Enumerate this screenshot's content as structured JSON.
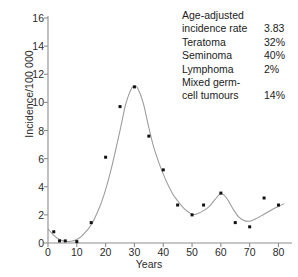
{
  "chart_data": {
    "type": "line",
    "title": "",
    "xlabel": "Years",
    "ylabel": "Incidence/100 000",
    "xlim": [
      0,
      84
    ],
    "ylim": [
      0,
      16
    ],
    "xticks": [
      0,
      10,
      20,
      30,
      40,
      50,
      60,
      70,
      80
    ],
    "yticks": [
      0,
      2,
      4,
      6,
      8,
      10,
      12,
      14,
      16
    ],
    "grid": false,
    "legend_position": "top-right",
    "series": [
      {
        "name": "Observed incidence",
        "marker": "square",
        "marker_color": "#111111",
        "x": [
          2,
          4,
          6,
          10,
          15,
          20,
          25,
          30,
          35,
          40,
          45,
          50,
          54,
          60,
          65,
          70,
          75,
          80
        ],
        "values": [
          0.8,
          0.15,
          0.15,
          0.1,
          1.45,
          6.1,
          9.7,
          11.1,
          7.6,
          5.2,
          2.7,
          2.0,
          2.7,
          3.55,
          1.45,
          1.15,
          3.2,
          2.7
        ]
      },
      {
        "name": "Fitted curve",
        "marker": "none",
        "line_color": "#9a9a9a",
        "x": [
          0,
          2,
          4,
          6,
          8,
          10,
          12,
          15,
          18,
          20,
          22,
          25,
          27,
          29,
          30,
          31,
          33,
          35,
          37,
          40,
          43,
          45,
          47,
          50,
          52,
          54,
          56,
          58,
          60,
          62,
          64,
          66,
          68,
          70,
          72,
          75,
          78,
          80,
          82
        ],
        "values": [
          1.0,
          0.55,
          0.25,
          0.12,
          0.12,
          0.25,
          0.55,
          1.3,
          2.6,
          3.8,
          5.3,
          8.0,
          9.9,
          11.0,
          11.15,
          11.05,
          10.0,
          8.2,
          6.6,
          4.9,
          3.6,
          3.0,
          2.5,
          2.05,
          2.1,
          2.3,
          2.6,
          3.1,
          3.5,
          3.2,
          2.5,
          1.9,
          1.6,
          1.55,
          1.7,
          2.05,
          2.4,
          2.6,
          2.8
        ]
      }
    ]
  },
  "legend": {
    "rows": [
      {
        "key": "Age-adjusted",
        "value": "",
        "single": true
      },
      {
        "key": "incidence rate",
        "value": "3.83",
        "single": false
      },
      {
        "key": "Teratoma",
        "value": "32%",
        "single": false
      },
      {
        "key": "Seminoma",
        "value": "40%",
        "single": false
      },
      {
        "key": "Lymphoma",
        "value": "2%",
        "single": false
      },
      {
        "key": "Mixed germ-",
        "value": "",
        "single": true
      },
      {
        "key": "cell tumours",
        "value": "14%",
        "single": false
      }
    ]
  }
}
